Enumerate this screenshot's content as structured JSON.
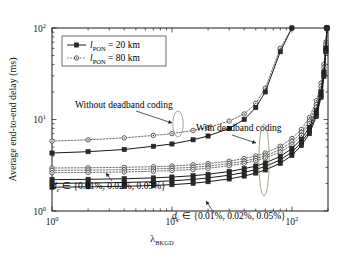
{
  "figure": {
    "background_color": "#ffffff",
    "frame_color": "#1a1a1a"
  },
  "axes": {
    "x": {
      "label_main": "λ",
      "label_sub": "BKGD",
      "tick_labels": [
        "10",
        "10",
        "10"
      ],
      "tick_exponents": [
        "0",
        "1",
        "2"
      ],
      "scale": "log",
      "min": 1,
      "max": 200
    },
    "y": {
      "label": "Average end-to-end delay (ms)",
      "tick_labels": [
        "10",
        "10",
        "10"
      ],
      "tick_exponents": [
        "0",
        "1",
        "2"
      ],
      "scale": "log",
      "min": 1,
      "max": 100
    }
  },
  "legend": {
    "items": [
      {
        "label_main": "l",
        "label_sub": "PON",
        "label_rest": " = 20 km",
        "marker": "filled-square",
        "line_style": "solid",
        "color": "#1a1a1a"
      },
      {
        "label_main": "l",
        "label_sub": "PON",
        "label_rest": " = 80 km",
        "marker": "open-circle",
        "line_style": "dotted",
        "color": "#555555"
      }
    ]
  },
  "annotations": [
    {
      "id": "without-deadband",
      "text": "Without deadband coding",
      "x": 75,
      "y": 108
    },
    {
      "id": "with-deadband",
      "text": "With deadband coding",
      "x": 196,
      "y": 131
    },
    {
      "id": "dc-upper",
      "text_main": "d",
      "text_sub": "c",
      "text_rest": " ∈ {0.01%, 0.02%, 0.05%}",
      "x": 52,
      "y": 189
    },
    {
      "id": "dc-lower",
      "text_main": "d",
      "text_sub": "c",
      "text_rest": " ∈ {0.01%, 0.02%, 0.05%}",
      "x": 172,
      "y": 219
    }
  ],
  "chart_data": {
    "type": "line",
    "title": "",
    "xlabel": "λ_BKGD",
    "ylabel": "Average end-to-end delay (ms)",
    "xscale": "log",
    "yscale": "log",
    "xlim": [
      1,
      200
    ],
    "ylim": [
      1,
      100
    ],
    "grid": false,
    "legend_position": "upper-left",
    "x": [
      1,
      2,
      4,
      7,
      10,
      15,
      20,
      30,
      40,
      50,
      60,
      80,
      100,
      120,
      140,
      160,
      175,
      185,
      192,
      196
    ],
    "series": [
      {
        "name": "l_PON = 80 km, without deadband coding",
        "group": "without-deadband",
        "l_pon_km": 80,
        "marker": "open-circle",
        "line_style": "dotted",
        "values": [
          5.8,
          6.0,
          6.3,
          6.7,
          7.0,
          7.6,
          8.2,
          9.6,
          11.5,
          15.0,
          22.0,
          60.0,
          100,
          null,
          null,
          null,
          null,
          null,
          null,
          null
        ]
      },
      {
        "name": "l_PON = 20 km, without deadband coding",
        "group": "without-deadband",
        "l_pon_km": 20,
        "marker": "filled-square",
        "line_style": "solid",
        "values": [
          4.3,
          4.45,
          4.7,
          5.1,
          5.4,
          6.0,
          6.6,
          8.0,
          10.0,
          13.5,
          20.0,
          55.0,
          100,
          null,
          null,
          null,
          null,
          null,
          null,
          null
        ]
      },
      {
        "name": "l_PON = 80 km, d_c = 0.05%, with deadband coding",
        "group": "with-deadband",
        "l_pon_km": 80,
        "d_c_percent": 0.05,
        "marker": "open-circle",
        "line_style": "dotted",
        "values": [
          2.95,
          2.97,
          3.0,
          3.05,
          3.1,
          3.2,
          3.3,
          3.5,
          3.75,
          4.0,
          4.3,
          5.1,
          6.2,
          7.8,
          10.5,
          16.0,
          25.0,
          40.0,
          70.0,
          100
        ]
      },
      {
        "name": "l_PON = 80 km, d_c = 0.02%, with deadband coding",
        "group": "with-deadband",
        "l_pon_km": 80,
        "d_c_percent": 0.02,
        "marker": "open-circle",
        "line_style": "dotted",
        "values": [
          2.78,
          2.8,
          2.83,
          2.88,
          2.93,
          3.0,
          3.1,
          3.3,
          3.5,
          3.75,
          4.0,
          4.7,
          5.7,
          7.2,
          9.6,
          14.5,
          23.0,
          37.0,
          66.0,
          100
        ]
      },
      {
        "name": "l_PON = 80 km, d_c = 0.01%, with deadband coding",
        "group": "with-deadband",
        "l_pon_km": 80,
        "d_c_percent": 0.01,
        "marker": "open-circle",
        "line_style": "dotted",
        "values": [
          2.62,
          2.64,
          2.67,
          2.72,
          2.77,
          2.84,
          2.93,
          3.12,
          3.32,
          3.55,
          3.8,
          4.4,
          5.3,
          6.7,
          9.0,
          13.5,
          21.0,
          34.0,
          62.0,
          100
        ]
      },
      {
        "name": "l_PON = 20 km, d_c = 0.05%, with deadband coding",
        "group": "with-deadband",
        "l_pon_km": 20,
        "d_c_percent": 0.05,
        "marker": "filled-square",
        "line_style": "solid",
        "values": [
          2.2,
          2.22,
          2.25,
          2.3,
          2.35,
          2.43,
          2.52,
          2.7,
          2.9,
          3.1,
          3.35,
          3.95,
          4.8,
          6.1,
          8.2,
          12.5,
          20.0,
          33.0,
          60.0,
          100
        ]
      },
      {
        "name": "l_PON = 20 km, d_c = 0.02%, with deadband coding",
        "group": "with-deadband",
        "l_pon_km": 20,
        "d_c_percent": 0.02,
        "marker": "filled-square",
        "line_style": "solid",
        "values": [
          2.0,
          2.02,
          2.05,
          2.09,
          2.14,
          2.21,
          2.3,
          2.46,
          2.64,
          2.84,
          3.07,
          3.62,
          4.4,
          5.6,
          7.5,
          11.5,
          18.5,
          31.0,
          57.0,
          100
        ]
      },
      {
        "name": "l_PON = 20 km, d_c = 0.01%, with deadband coding",
        "group": "with-deadband",
        "l_pon_km": 20,
        "d_c_percent": 0.01,
        "marker": "filled-square",
        "line_style": "solid",
        "values": [
          1.82,
          1.84,
          1.86,
          1.9,
          1.94,
          2.01,
          2.09,
          2.24,
          2.41,
          2.6,
          2.81,
          3.32,
          4.05,
          5.2,
          7.0,
          10.8,
          17.5,
          29.5,
          55.0,
          100
        ]
      }
    ]
  }
}
